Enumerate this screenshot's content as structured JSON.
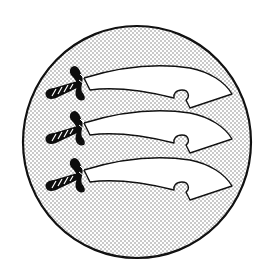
{
  "emblem": {
    "subject": "Three seaxes on a roundel",
    "alt": "Circular emblem with three curved seax swords with twisted hilts, blades pointing right, on a stippled background",
    "count": 3,
    "colors": {
      "background": "#ffffff",
      "field_dots": "#7a7a7a",
      "outline": "#111111",
      "blade": "#ffffff",
      "hilt": "#0d0d0d"
    },
    "roundel": {
      "cx": 137,
      "cy": 142,
      "rx": 114,
      "ry": 116
    },
    "seax_offsets_y": [
      0,
      45,
      92
    ]
  }
}
